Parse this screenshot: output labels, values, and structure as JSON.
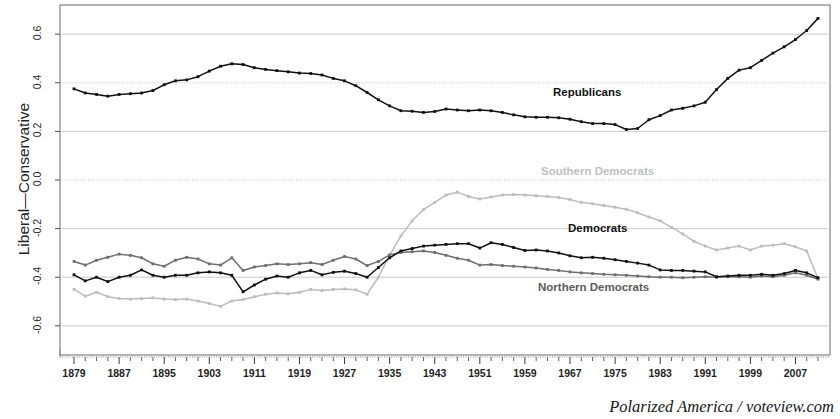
{
  "caption": "Polarized America / voteview.com",
  "axis": {
    "ylabel": "Liberal—Conservative",
    "yticks": [
      "0.6",
      "0.4",
      "0.2",
      "0.0",
      "-0.2",
      "-0.4",
      "-0.6"
    ],
    "xticks": [
      "1879",
      "1887",
      "1895",
      "1903",
      "1911",
      "1919",
      "1927",
      "1935",
      "1943",
      "1951",
      "1959",
      "1967",
      "1975",
      "1983",
      "1991",
      "1999",
      "2007"
    ]
  },
  "labels": {
    "republicans": "Republicans",
    "southern_democrats": "Southern Democrats",
    "democrats": "Democrats",
    "northern_democrats": "Northern Democrats"
  },
  "colors": {
    "republicans": "#111111",
    "democrats": "#111111",
    "northern_democrats": "#6e6e6e",
    "southern_democrats": "#bcbcbc",
    "grid": "#9a9a9a",
    "frame": "#6a6a6a",
    "text": "#1a1a1a"
  },
  "chart_data": {
    "type": "line",
    "title": "",
    "xlabel": "",
    "ylabel": "Liberal—Conservative",
    "xlim": [
      1879,
      2011
    ],
    "ylim": [
      -0.72,
      0.72
    ],
    "grid": true,
    "gridlines_y": [
      0.6,
      0.4,
      0.2,
      0.0,
      -0.2,
      -0.4,
      -0.6
    ],
    "legend": "inline-annotations",
    "x": [
      1879,
      1881,
      1883,
      1885,
      1887,
      1889,
      1891,
      1893,
      1895,
      1897,
      1899,
      1901,
      1903,
      1905,
      1907,
      1909,
      1911,
      1913,
      1915,
      1917,
      1919,
      1921,
      1923,
      1925,
      1927,
      1929,
      1931,
      1933,
      1935,
      1937,
      1939,
      1941,
      1943,
      1945,
      1947,
      1949,
      1951,
      1953,
      1955,
      1957,
      1959,
      1961,
      1963,
      1965,
      1967,
      1969,
      1971,
      1973,
      1975,
      1977,
      1979,
      1981,
      1983,
      1985,
      1987,
      1989,
      1991,
      1993,
      1995,
      1997,
      1999,
      2001,
      2003,
      2005,
      2007,
      2009,
      2011
    ],
    "series": [
      {
        "name": "Republicans",
        "color": "#111111",
        "values": [
          0.375,
          0.358,
          0.352,
          0.345,
          0.352,
          0.355,
          0.358,
          0.368,
          0.392,
          0.408,
          0.412,
          0.425,
          0.448,
          0.468,
          0.478,
          0.475,
          0.462,
          0.455,
          0.45,
          0.445,
          0.44,
          0.438,
          0.432,
          0.418,
          0.408,
          0.388,
          0.36,
          0.33,
          0.305,
          0.285,
          0.283,
          0.278,
          0.282,
          0.292,
          0.288,
          0.285,
          0.288,
          0.285,
          0.278,
          0.268,
          0.26,
          0.258,
          0.258,
          0.256,
          0.25,
          0.24,
          0.232,
          0.232,
          0.228,
          0.208,
          0.212,
          0.248,
          0.265,
          0.288,
          0.295,
          0.305,
          0.32,
          0.372,
          0.418,
          0.452,
          0.462,
          0.492,
          0.522,
          0.548,
          0.578,
          0.615,
          0.665
        ]
      },
      {
        "name": "Democrats",
        "color": "#111111",
        "values": [
          -0.39,
          -0.415,
          -0.4,
          -0.418,
          -0.4,
          -0.392,
          -0.37,
          -0.392,
          -0.4,
          -0.392,
          -0.392,
          -0.382,
          -0.378,
          -0.382,
          -0.392,
          -0.46,
          -0.432,
          -0.408,
          -0.395,
          -0.4,
          -0.382,
          -0.372,
          -0.39,
          -0.38,
          -0.375,
          -0.385,
          -0.4,
          -0.36,
          -0.32,
          -0.292,
          -0.282,
          -0.272,
          -0.268,
          -0.265,
          -0.262,
          -0.262,
          -0.28,
          -0.258,
          -0.265,
          -0.278,
          -0.29,
          -0.288,
          -0.292,
          -0.3,
          -0.312,
          -0.32,
          -0.318,
          -0.322,
          -0.328,
          -0.335,
          -0.342,
          -0.35,
          -0.37,
          -0.372,
          -0.372,
          -0.375,
          -0.378,
          -0.398,
          -0.395,
          -0.392,
          -0.392,
          -0.388,
          -0.392,
          -0.385,
          -0.372,
          -0.382,
          -0.402
        ]
      },
      {
        "name": "Northern Democrats",
        "color": "#6e6e6e",
        "values": [
          -0.335,
          -0.35,
          -0.33,
          -0.318,
          -0.305,
          -0.31,
          -0.32,
          -0.345,
          -0.355,
          -0.33,
          -0.318,
          -0.325,
          -0.345,
          -0.35,
          -0.32,
          -0.372,
          -0.358,
          -0.352,
          -0.345,
          -0.348,
          -0.345,
          -0.34,
          -0.348,
          -0.33,
          -0.315,
          -0.325,
          -0.352,
          -0.335,
          -0.308,
          -0.298,
          -0.295,
          -0.292,
          -0.298,
          -0.31,
          -0.322,
          -0.33,
          -0.35,
          -0.348,
          -0.352,
          -0.355,
          -0.358,
          -0.362,
          -0.368,
          -0.372,
          -0.378,
          -0.382,
          -0.385,
          -0.388,
          -0.39,
          -0.392,
          -0.395,
          -0.398,
          -0.4,
          -0.4,
          -0.402,
          -0.4,
          -0.398,
          -0.4,
          -0.398,
          -0.398,
          -0.4,
          -0.395,
          -0.398,
          -0.392,
          -0.382,
          -0.392,
          -0.408
        ]
      },
      {
        "name": "Southern Democrats",
        "color": "#bcbcbc",
        "values": [
          -0.45,
          -0.478,
          -0.462,
          -0.48,
          -0.488,
          -0.49,
          -0.488,
          -0.485,
          -0.49,
          -0.492,
          -0.49,
          -0.498,
          -0.508,
          -0.52,
          -0.498,
          -0.492,
          -0.48,
          -0.47,
          -0.465,
          -0.468,
          -0.462,
          -0.45,
          -0.455,
          -0.45,
          -0.448,
          -0.452,
          -0.47,
          -0.4,
          -0.31,
          -0.23,
          -0.168,
          -0.122,
          -0.092,
          -0.062,
          -0.05,
          -0.068,
          -0.078,
          -0.07,
          -0.062,
          -0.06,
          -0.062,
          -0.065,
          -0.068,
          -0.072,
          -0.08,
          -0.092,
          -0.098,
          -0.105,
          -0.112,
          -0.12,
          -0.135,
          -0.152,
          -0.168,
          -0.195,
          -0.222,
          -0.252,
          -0.272,
          -0.288,
          -0.28,
          -0.272,
          -0.288,
          -0.272,
          -0.268,
          -0.262,
          -0.275,
          -0.292,
          -0.405
        ]
      }
    ]
  }
}
